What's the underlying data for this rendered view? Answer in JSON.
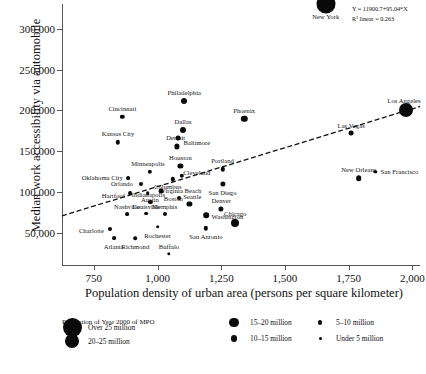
{
  "chart_data": {
    "type": "scatter",
    "title": "",
    "xlabel": "Population density of urban area (persons per square kilometer)",
    "ylabel": "Median work accessibility via automobile",
    "xlim": [
      625,
      2030
    ],
    "ylim": [
      10000,
      330000
    ],
    "xticks": [
      750,
      1000,
      1250,
      1500,
      1750,
      2000
    ],
    "xtick_labels": [
      "750",
      "1,000",
      "1,250",
      "1,500",
      "1,750",
      "2,000"
    ],
    "yticks": [
      50000,
      100000,
      150000,
      200000,
      250000,
      300000
    ],
    "ytick_labels": [
      "50,000",
      "100,000",
      "150,000",
      "200,000",
      "250,000",
      "300,000"
    ],
    "grid": false,
    "legend_position": "bottom-left",
    "annotation": {
      "equation": "Y = 11900.7+95.04*X",
      "r2": "R² linear = 0.263"
    },
    "fit_line": {
      "style": "dashed",
      "intercept": 11900.7,
      "slope": 95.04,
      "x_start": 625,
      "x_end": 2030
    },
    "points": [
      {
        "city": "New York",
        "x": 1660,
        "y": 330000,
        "size": 9.5,
        "label_dx": 0,
        "label_dy": 12
      },
      {
        "city": "Los Angeles",
        "x": 1975,
        "y": 201000,
        "size": 7.0,
        "label_dx": -2,
        "label_dy": -10
      },
      {
        "city": "Philadelphia",
        "x": 1105,
        "y": 211000,
        "size": 3.0,
        "label_dx": 0,
        "label_dy": -9
      },
      {
        "city": "Phoenix",
        "x": 1340,
        "y": 190000,
        "size": 3.2,
        "label_dx": 0,
        "label_dy": -9
      },
      {
        "city": "Cincinnati",
        "x": 862,
        "y": 192000,
        "size": 2.2,
        "label_dx": 0,
        "label_dy": -9
      },
      {
        "city": "Dallas",
        "x": 1100,
        "y": 176000,
        "size": 3.0,
        "label_dx": 0,
        "label_dy": -9
      },
      {
        "city": "Las Vegas",
        "x": 1760,
        "y": 172000,
        "size": 2.4,
        "label_dx": 0,
        "label_dy": -8
      },
      {
        "city": "Baltimore",
        "x": 1080,
        "y": 166000,
        "size": 2.4,
        "label_dx": 19,
        "label_dy": 4
      },
      {
        "city": "Kansas City",
        "x": 845,
        "y": 161000,
        "size": 2.2,
        "label_dx": 0,
        "label_dy": -9
      },
      {
        "city": "Detroit",
        "x": 1075,
        "y": 156000,
        "size": 2.6,
        "label_dx": -1,
        "label_dy": -9
      },
      {
        "city": "Houston",
        "x": 1090,
        "y": 132000,
        "size": 2.6,
        "label_dx": 0,
        "label_dy": -9
      },
      {
        "city": "Portland",
        "x": 1255,
        "y": 128000,
        "size": 2.2,
        "label_dx": 0,
        "label_dy": -9
      },
      {
        "city": "San Francisco",
        "x": 1855,
        "y": 125000,
        "size": 1.7,
        "label_dx": 24,
        "label_dy": -1
      },
      {
        "city": "Minneapolis",
        "x": 970,
        "y": 125000,
        "size": 2.2,
        "label_dx": -2,
        "label_dy": -9
      },
      {
        "city": "Cleveland",
        "x": 1095,
        "y": 120000,
        "size": 2.2,
        "label_dx": 15,
        "label_dy": -4
      },
      {
        "city": "New Orleans",
        "x": 1790,
        "y": 117000,
        "size": 2.8,
        "label_dx": 0,
        "label_dy": -9
      },
      {
        "city": "Oklahoma City",
        "x": 885,
        "y": 117000,
        "size": 1.9,
        "label_dx": -26,
        "label_dy": -1
      },
      {
        "city": "Columbus",
        "x": 1060,
        "y": 116000,
        "size": 2.2,
        "label_dx": -5,
        "label_dy": 7
      },
      {
        "city": "Orlando",
        "x": 935,
        "y": 110000,
        "size": 2.0,
        "label_dx": -19,
        "label_dy": -1
      },
      {
        "city": "San Diego",
        "x": 1255,
        "y": 110000,
        "size": 2.6,
        "label_dx": 0,
        "label_dy": 8
      },
      {
        "city": "Boston",
        "x": 1015,
        "y": 101000,
        "size": 2.4,
        "label_dx": 12,
        "label_dy": 7
      },
      {
        "city": "Hartford",
        "x": 893,
        "y": 99000,
        "size": 1.9,
        "label_dx": -17,
        "label_dy": 2
      },
      {
        "city": "Austin",
        "x": 962,
        "y": 99000,
        "size": 1.8,
        "label_dx": 2,
        "label_dy": 6
      },
      {
        "city": "Virginia Beach",
        "x": 1085,
        "y": 93000,
        "size": 2.0,
        "label_dx": 2,
        "label_dy": -8
      },
      {
        "city": "Indianapolis",
        "x": 972,
        "y": 88000,
        "size": 2.1,
        "label_dx": -2,
        "label_dy": -8
      },
      {
        "city": "Seattle",
        "x": 1125,
        "y": 86000,
        "size": 2.6,
        "label_dx": 3,
        "label_dy": -8
      },
      {
        "city": "Denver",
        "x": 1250,
        "y": 80000,
        "size": 2.6,
        "label_dx": 0,
        "label_dy": -9
      },
      {
        "city": "Louisville",
        "x": 955,
        "y": 74000,
        "size": 1.9,
        "label_dx": 0,
        "label_dy": -8
      },
      {
        "city": "Memphis",
        "x": 1028,
        "y": 73000,
        "size": 2.0,
        "label_dx": 0,
        "label_dy": -8
      },
      {
        "city": "Nashville",
        "x": 880,
        "y": 73000,
        "size": 1.9,
        "label_dx": 0,
        "label_dy": -8
      },
      {
        "city": "Washington",
        "x": 1192,
        "y": 72000,
        "size": 2.8,
        "label_dx": 21,
        "label_dy": 1
      },
      {
        "city": "Chicago",
        "x": 1305,
        "y": 62000,
        "size": 4.0,
        "label_dx": 0,
        "label_dy": -10
      },
      {
        "city": "Rochester",
        "x": 1000,
        "y": 58000,
        "size": 1.8,
        "label_dx": 0,
        "label_dy": 8
      },
      {
        "city": "San Antonio",
        "x": 1190,
        "y": 56000,
        "size": 2.2,
        "label_dx": 0,
        "label_dy": 8
      },
      {
        "city": "Charlotte",
        "x": 815,
        "y": 55000,
        "size": 2.0,
        "label_dx": -19,
        "label_dy": 1
      },
      {
        "city": "Richmond",
        "x": 913,
        "y": 44000,
        "size": 1.8,
        "label_dx": 0,
        "label_dy": 8
      },
      {
        "city": "Atlanta",
        "x": 828,
        "y": 44000,
        "size": 1.9,
        "label_dx": 0,
        "label_dy": 8
      },
      {
        "city": "Buffalo",
        "x": 1045,
        "y": 25000,
        "size": 1.7,
        "label_dx": 0,
        "label_dy": -8
      }
    ]
  },
  "legend": {
    "title": "Population of Year 2000 of MPO",
    "items": [
      {
        "label": "Over 25 million",
        "size": 9.5,
        "col": 0,
        "row": 0
      },
      {
        "label": "20–25 million",
        "size": 7.0,
        "col": 0,
        "row": 1
      },
      {
        "label": "15–20 million",
        "size": 4.6,
        "col": 1,
        "row": 0
      },
      {
        "label": "10–15 million",
        "size": 3.4,
        "col": 1,
        "row": 1
      },
      {
        "label": "5–10 million",
        "size": 2.1,
        "col": 2,
        "row": 0
      },
      {
        "label": "Under 5 million",
        "size": 1.5,
        "col": 2,
        "row": 1
      }
    ]
  },
  "colors": {
    "marker": "#0a0a0a",
    "axis": "#555555",
    "text": "#111111",
    "fit_line": "#111111"
  }
}
